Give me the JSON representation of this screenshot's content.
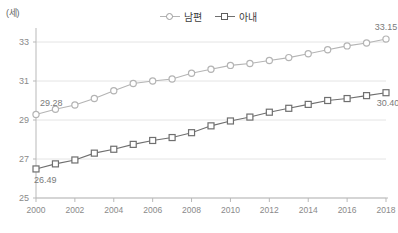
{
  "unit_label": "(세)",
  "legend": {
    "position": "top-center",
    "items": [
      {
        "label": "남편",
        "marker": "circle-outline-icon",
        "color": "#b4b4b4"
      },
      {
        "label": "아내",
        "marker": "square-outline-icon",
        "color": "#6f6f6f"
      }
    ]
  },
  "chart_data": {
    "type": "line",
    "title": "",
    "subtitle": "",
    "xlabel": "",
    "ylabel": "(세)",
    "grid": true,
    "legend_position": "top-center",
    "x": [
      2000,
      2001,
      2002,
      2003,
      2004,
      2005,
      2006,
      2007,
      2008,
      2009,
      2010,
      2011,
      2012,
      2013,
      2014,
      2015,
      2016,
      2017,
      2018
    ],
    "xlim": [
      2000,
      2018
    ],
    "ylim": [
      25,
      33.6
    ],
    "yticks": [
      25,
      27,
      29,
      31,
      33
    ],
    "xticks": [
      2000,
      2002,
      2004,
      2006,
      2008,
      2010,
      2012,
      2014,
      2016,
      2018
    ],
    "xtick_labels": [
      "2000",
      "2002",
      "2004",
      "2006",
      "2008",
      "2010",
      "2012",
      "2014",
      "2016",
      "2018"
    ],
    "ytick_labels": [
      "25",
      "27",
      "29",
      "31",
      "33"
    ],
    "series": [
      {
        "name": "남편",
        "color": "#b4b4b4",
        "marker": "circle",
        "values": [
          29.28,
          29.55,
          29.77,
          30.1,
          30.5,
          30.87,
          31.0,
          31.1,
          31.4,
          31.6,
          31.8,
          31.9,
          32.05,
          32.2,
          32.4,
          32.6,
          32.8,
          32.95,
          33.15
        ]
      },
      {
        "name": "아내",
        "color": "#6f6f6f",
        "marker": "square",
        "values": [
          26.49,
          26.75,
          26.95,
          27.3,
          27.5,
          27.75,
          27.95,
          28.1,
          28.35,
          28.7,
          28.95,
          29.15,
          29.4,
          29.6,
          29.8,
          30.0,
          30.1,
          30.25,
          30.4
        ]
      }
    ],
    "annotations": [
      {
        "text": "29.28",
        "x": 2000,
        "y": 29.28,
        "series": "남편"
      },
      {
        "text": "33.15",
        "x": 2018,
        "y": 33.15,
        "series": "남편"
      },
      {
        "text": "26.49",
        "x": 2000,
        "y": 26.49,
        "series": "아내"
      },
      {
        "text": "30.40",
        "x": 2018,
        "y": 30.4,
        "series": "아내"
      }
    ]
  }
}
